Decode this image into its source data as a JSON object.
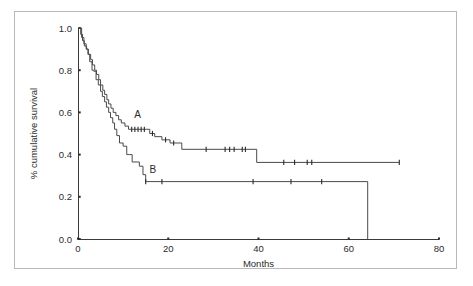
{
  "figure": {
    "frame_color": "#b9b9b9",
    "background": "#ffffff"
  },
  "chart_data": {
    "type": "line",
    "subtype": "kaplan-meier-step",
    "title": "",
    "xlabel": "Months",
    "ylabel": "% cumulative survival",
    "xlim": [
      0,
      80
    ],
    "ylim": [
      0.0,
      1.0
    ],
    "xticks": [
      0,
      20,
      40,
      60,
      80
    ],
    "xticklabels": [
      "0",
      "20",
      "40",
      "60",
      "80"
    ],
    "yticks": [
      0.0,
      0.2,
      0.4,
      0.6,
      0.8,
      1.0
    ],
    "yticklabels": [
      "0.0",
      "0.2",
      "0.4",
      "0.6",
      "0.8",
      "1.0"
    ],
    "grid": false,
    "legend": "inline-labels",
    "line_color": "#4a4a4a",
    "series": [
      {
        "name": "A",
        "label": "A",
        "label_x": 13.2,
        "label_y": 0.575,
        "steps": [
          [
            0.0,
            1.0
          ],
          [
            0.6,
            0.97
          ],
          [
            1.0,
            0.94
          ],
          [
            1.4,
            0.915
          ],
          [
            1.9,
            0.9
          ],
          [
            2.3,
            0.875
          ],
          [
            2.8,
            0.85
          ],
          [
            3.2,
            0.825
          ],
          [
            3.7,
            0.8
          ],
          [
            4.1,
            0.78
          ],
          [
            4.6,
            0.755
          ],
          [
            5.0,
            0.73
          ],
          [
            5.5,
            0.705
          ],
          [
            5.9,
            0.685
          ],
          [
            6.4,
            0.66
          ],
          [
            6.8,
            0.64
          ],
          [
            7.3,
            0.62
          ],
          [
            7.8,
            0.6
          ],
          [
            8.4,
            0.585
          ],
          [
            9.0,
            0.565
          ],
          [
            9.6,
            0.55
          ],
          [
            10.4,
            0.535
          ],
          [
            11.2,
            0.52
          ],
          [
            15.2,
            0.52
          ],
          [
            15.9,
            0.5
          ],
          [
            17.0,
            0.485
          ],
          [
            18.6,
            0.47
          ],
          [
            20.4,
            0.455
          ],
          [
            22.6,
            0.455
          ],
          [
            23.0,
            0.425
          ],
          [
            39.2,
            0.425
          ],
          [
            39.6,
            0.363
          ],
          [
            71.2,
            0.363
          ]
        ],
        "censor_times": [
          11.9,
          12.6,
          13.3,
          14.0,
          14.7,
          16.5,
          19.4,
          21.2,
          28.4,
          32.6,
          33.6,
          34.6,
          36.4,
          37.1,
          45.6,
          48.0,
          50.8,
          51.8,
          71.2
        ],
        "final_survival": 0.363
      },
      {
        "name": "B",
        "label": "B",
        "label_x": 16.6,
        "label_y": 0.315,
        "steps": [
          [
            0.0,
            1.0
          ],
          [
            0.8,
            0.955
          ],
          [
            1.3,
            0.925
          ],
          [
            1.8,
            0.9
          ],
          [
            2.2,
            0.875
          ],
          [
            2.6,
            0.84
          ],
          [
            3.1,
            0.8
          ],
          [
            3.5,
            0.795
          ],
          [
            4.0,
            0.755
          ],
          [
            4.5,
            0.73
          ],
          [
            5.0,
            0.7
          ],
          [
            5.4,
            0.675
          ],
          [
            5.9,
            0.65
          ],
          [
            6.3,
            0.625
          ],
          [
            6.8,
            0.6
          ],
          [
            7.2,
            0.575
          ],
          [
            7.7,
            0.55
          ],
          [
            8.1,
            0.52
          ],
          [
            8.6,
            0.49
          ],
          [
            9.2,
            0.455
          ],
          [
            10.0,
            0.44
          ],
          [
            10.8,
            0.4
          ],
          [
            11.4,
            0.4
          ],
          [
            12.0,
            0.365
          ],
          [
            13.6,
            0.345
          ],
          [
            14.4,
            0.305
          ],
          [
            15.0,
            0.272
          ],
          [
            64.2,
            0.272
          ],
          [
            64.2,
            0.0
          ]
        ],
        "censor_times": [
          15.0,
          18.6,
          38.8,
          47.2,
          54.0
        ],
        "final_survival": 0.0,
        "drop_to_zero_month": 64.2
      }
    ]
  }
}
